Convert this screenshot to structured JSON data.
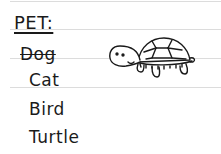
{
  "heading": "PET:",
  "items": [
    {
      "label": "Dog",
      "struck": true
    },
    {
      "label": "Cat",
      "struck": false
    },
    {
      "label": "Bird",
      "struck": false
    },
    {
      "label": "Turtle",
      "struck": false
    }
  ],
  "illustration": {
    "icon": "turtle-icon"
  }
}
